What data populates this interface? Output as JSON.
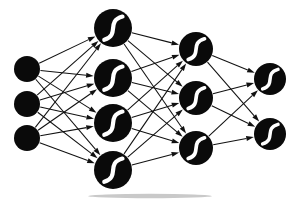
{
  "figure": {
    "background_color": "#ffffff",
    "node_color": "#0a0a0a",
    "edge_color": "#111111",
    "activation_glyph_color": "#ffffff",
    "width": 299,
    "height": 203
  },
  "diagram_data": {
    "type": "diagram",
    "graph_kind": "neural-network",
    "architecture": [
      3,
      4,
      3,
      2
    ],
    "total_nodes": 12,
    "total_edges": 38,
    "fully_connected": true,
    "edge_direction": "left-to-right",
    "edge_style": "single-headed-arrow",
    "layers": [
      {
        "index": 0,
        "name": "input-layer",
        "role": "input",
        "node_count": 3,
        "has_activation_glyph": false,
        "center_x": 27,
        "radius": 13,
        "nodes": [
          {
            "id": "i1",
            "label": "",
            "cx": 27,
            "cy": 69,
            "r": 13
          },
          {
            "id": "i2",
            "label": "",
            "cx": 27,
            "cy": 104,
            "r": 13
          },
          {
            "id": "i3",
            "label": "",
            "cx": 27,
            "cy": 138,
            "r": 13
          }
        ]
      },
      {
        "index": 1,
        "name": "hidden-layer-1",
        "role": "hidden",
        "node_count": 4,
        "has_activation_glyph": true,
        "center_x": 113,
        "radius": 19,
        "nodes": [
          {
            "id": "h1_1",
            "label": "",
            "cx": 113,
            "cy": 28,
            "r": 19
          },
          {
            "id": "h1_2",
            "label": "",
            "cx": 113,
            "cy": 78,
            "r": 19
          },
          {
            "id": "h1_3",
            "label": "",
            "cx": 113,
            "cy": 123,
            "r": 19
          },
          {
            "id": "h1_4",
            "label": "",
            "cx": 113,
            "cy": 170,
            "r": 19
          }
        ]
      },
      {
        "index": 2,
        "name": "hidden-layer-2",
        "role": "hidden",
        "node_count": 3,
        "has_activation_glyph": true,
        "center_x": 196,
        "radius": 17,
        "nodes": [
          {
            "id": "h2_1",
            "label": "",
            "cx": 196,
            "cy": 49,
            "r": 17
          },
          {
            "id": "h2_2",
            "label": "",
            "cx": 196,
            "cy": 98,
            "r": 17
          },
          {
            "id": "h2_3",
            "label": "",
            "cx": 196,
            "cy": 148,
            "r": 17
          }
        ]
      },
      {
        "index": 3,
        "name": "output-layer",
        "role": "output",
        "node_count": 2,
        "has_activation_glyph": true,
        "center_x": 270,
        "radius": 16,
        "nodes": [
          {
            "id": "o1",
            "label": "",
            "cx": 270,
            "cy": 79,
            "r": 16
          },
          {
            "id": "o2",
            "label": "",
            "cx": 270,
            "cy": 134,
            "r": 16
          }
        ]
      }
    ],
    "activation_glyph": {
      "name": "sigmoid-curve",
      "shape": "s-curve",
      "orientation": "lower-left-to-upper-right",
      "color": "#ffffff"
    },
    "connections": [
      {
        "from": "i1",
        "to": "h1_1"
      },
      {
        "from": "i1",
        "to": "h1_2"
      },
      {
        "from": "i1",
        "to": "h1_3"
      },
      {
        "from": "i1",
        "to": "h1_4"
      },
      {
        "from": "i2",
        "to": "h1_1"
      },
      {
        "from": "i2",
        "to": "h1_2"
      },
      {
        "from": "i2",
        "to": "h1_3"
      },
      {
        "from": "i2",
        "to": "h1_4"
      },
      {
        "from": "i3",
        "to": "h1_1"
      },
      {
        "from": "i3",
        "to": "h1_2"
      },
      {
        "from": "i3",
        "to": "h1_3"
      },
      {
        "from": "i3",
        "to": "h1_4"
      },
      {
        "from": "h1_1",
        "to": "h2_1"
      },
      {
        "from": "h1_1",
        "to": "h2_2"
      },
      {
        "from": "h1_1",
        "to": "h2_3"
      },
      {
        "from": "h1_2",
        "to": "h2_1"
      },
      {
        "from": "h1_2",
        "to": "h2_2"
      },
      {
        "from": "h1_2",
        "to": "h2_3"
      },
      {
        "from": "h1_3",
        "to": "h2_1"
      },
      {
        "from": "h1_3",
        "to": "h2_2"
      },
      {
        "from": "h1_3",
        "to": "h2_3"
      },
      {
        "from": "h1_4",
        "to": "h2_1"
      },
      {
        "from": "h1_4",
        "to": "h2_2"
      },
      {
        "from": "h1_4",
        "to": "h2_3"
      },
      {
        "from": "h2_1",
        "to": "o1"
      },
      {
        "from": "h2_1",
        "to": "o2"
      },
      {
        "from": "h2_2",
        "to": "o1"
      },
      {
        "from": "h2_2",
        "to": "o2"
      },
      {
        "from": "h2_3",
        "to": "o1"
      },
      {
        "from": "h2_3",
        "to": "o2"
      }
    ]
  }
}
